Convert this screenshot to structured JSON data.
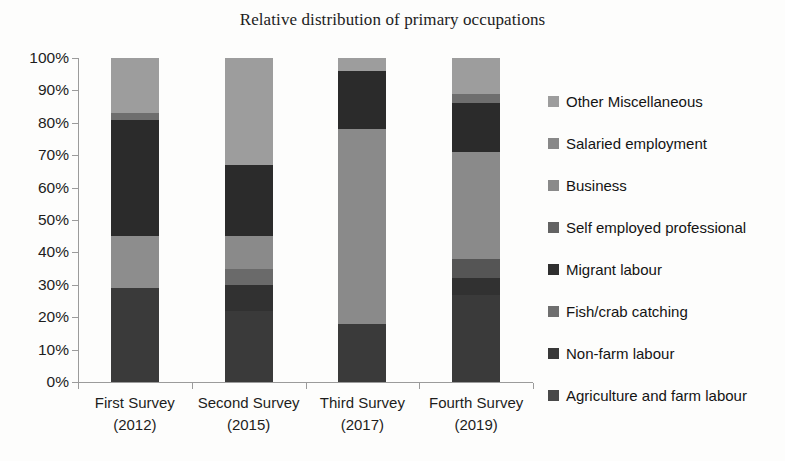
{
  "chart_data": {
    "type": "bar",
    "stacked": true,
    "normalized": true,
    "title": "Relative distribution of primary occupations",
    "xlabel": "",
    "ylabel": "",
    "ylim": [
      0,
      100
    ],
    "ytick_labels": [
      "100%",
      "90%",
      "80%",
      "70%",
      "60%",
      "50%",
      "40%",
      "30%",
      "20%",
      "10%",
      "0%"
    ],
    "ytick_values": [
      100,
      90,
      80,
      70,
      60,
      50,
      40,
      30,
      20,
      10,
      0
    ],
    "grid": false,
    "legend_position": "right",
    "categories": [
      "First Survey (2012)",
      "Second Survey (2015)",
      "Third Survey (2017)",
      "Fourth Survey (2019)"
    ],
    "category_lines": [
      [
        "First Survey",
        "(2012)"
      ],
      [
        "Second Survey",
        "(2015)"
      ],
      [
        "Third Survey",
        "(2017)"
      ],
      [
        "Fourth Survey",
        "(2019)"
      ]
    ],
    "series": [
      {
        "name": "Agriculture and farm labour",
        "color": "#3a3a3a",
        "values": [
          29,
          22,
          18,
          27
        ]
      },
      {
        "name": "Non-farm labour",
        "color": "#313131",
        "values": [
          0,
          8,
          0,
          5
        ]
      },
      {
        "name": "Fish/crab catching",
        "color": "#8d8d8d",
        "values": [
          16,
          5,
          0,
          6
        ]
      },
      {
        "name": "Migrant labour",
        "color": "#2b2b2b",
        "values": [
          36,
          10,
          0,
          0
        ]
      },
      {
        "name": "Self employed professional",
        "color": "#555555",
        "values": [
          0,
          0,
          0,
          0
        ]
      },
      {
        "name": "Business",
        "color": "#8a8a8a",
        "values": [
          0,
          22,
          60,
          33
        ]
      },
      {
        "name": "Salaried employment",
        "color": "#6e6e6e",
        "values": [
          2,
          0,
          18,
          15
        ]
      },
      {
        "name": "Other Miscellaneous",
        "color": "#9d9d9d",
        "values": [
          17,
          33,
          4,
          14
        ]
      }
    ],
    "bars": [
      {
        "category": "First Survey (2012)",
        "segments": [
          {
            "name": "Agriculture and farm labour",
            "start": 0,
            "end": 29,
            "value": 29,
            "color": "#3a3a3a"
          },
          {
            "name": "Fish/crab catching",
            "start": 29,
            "end": 45,
            "value": 16,
            "color": "#8d8d8d"
          },
          {
            "name": "Migrant labour",
            "start": 45,
            "end": 81,
            "value": 36,
            "color": "#2b2b2b"
          },
          {
            "name": "Salaried employment",
            "start": 81,
            "end": 83,
            "value": 2,
            "color": "#6e6e6e"
          },
          {
            "name": "Other Miscellaneous",
            "start": 83,
            "end": 100,
            "value": 17,
            "color": "#9d9d9d"
          }
        ]
      },
      {
        "category": "Second Survey (2015)",
        "segments": [
          {
            "name": "Agriculture and farm labour",
            "start": 0,
            "end": 22,
            "value": 22,
            "color": "#3a3a3a"
          },
          {
            "name": "Non-farm labour",
            "start": 22,
            "end": 30,
            "value": 8,
            "color": "#313131"
          },
          {
            "name": "Fish/crab catching",
            "start": 30,
            "end": 35,
            "value": 5,
            "color": "#6a6a6a"
          },
          {
            "name": "Business",
            "start": 35,
            "end": 45,
            "value": 10,
            "color": "#8a8a8a"
          },
          {
            "name": "Migrant labour",
            "start": 45,
            "end": 67,
            "value": 22,
            "color": "#2b2b2b"
          },
          {
            "name": "Other Miscellaneous",
            "start": 67,
            "end": 100,
            "value": 33,
            "color": "#9d9d9d"
          }
        ]
      },
      {
        "category": "Third Survey (2017)",
        "segments": [
          {
            "name": "Agriculture and farm labour",
            "start": 0,
            "end": 18,
            "value": 18,
            "color": "#3a3a3a"
          },
          {
            "name": "Business",
            "start": 18,
            "end": 78,
            "value": 60,
            "color": "#8a8a8a"
          },
          {
            "name": "Migrant labour",
            "start": 78,
            "end": 96,
            "value": 18,
            "color": "#2b2b2b"
          },
          {
            "name": "Other Miscellaneous",
            "start": 96,
            "end": 100,
            "value": 4,
            "color": "#9d9d9d"
          }
        ]
      },
      {
        "category": "Fourth Survey (2019)",
        "segments": [
          {
            "name": "Agriculture and farm labour",
            "start": 0,
            "end": 27,
            "value": 27,
            "color": "#3a3a3a"
          },
          {
            "name": "Non-farm labour",
            "start": 27,
            "end": 32,
            "value": 5,
            "color": "#313131"
          },
          {
            "name": "Fish/crab catching",
            "start": 32,
            "end": 38,
            "value": 6,
            "color": "#555555"
          },
          {
            "name": "Business",
            "start": 38,
            "end": 71,
            "value": 33,
            "color": "#8a8a8a"
          },
          {
            "name": "Migrant labour",
            "start": 71,
            "end": 86,
            "value": 15,
            "color": "#2b2b2b"
          },
          {
            "name": "Salaried employment",
            "start": 86,
            "end": 89,
            "value": 3,
            "color": "#6e6e6e"
          },
          {
            "name": "Other Miscellaneous",
            "start": 89,
            "end": 100,
            "value": 11,
            "color": "#9d9d9d"
          }
        ]
      }
    ],
    "legend": [
      {
        "label": "Other Miscellaneous",
        "color": "#9d9d9d"
      },
      {
        "label": "Salaried employment",
        "color": "#888888"
      },
      {
        "label": "Business",
        "color": "#8a8a8a"
      },
      {
        "label": "Self employed professional",
        "color": "#636363"
      },
      {
        "label": "Migrant labour",
        "color": "#2f2f2f"
      },
      {
        "label": "Fish/crab catching",
        "color": "#6f6f6f"
      },
      {
        "label": "Non-farm labour",
        "color": "#383838"
      },
      {
        "label": "Agriculture and farm labour",
        "color": "#494949"
      }
    ]
  }
}
